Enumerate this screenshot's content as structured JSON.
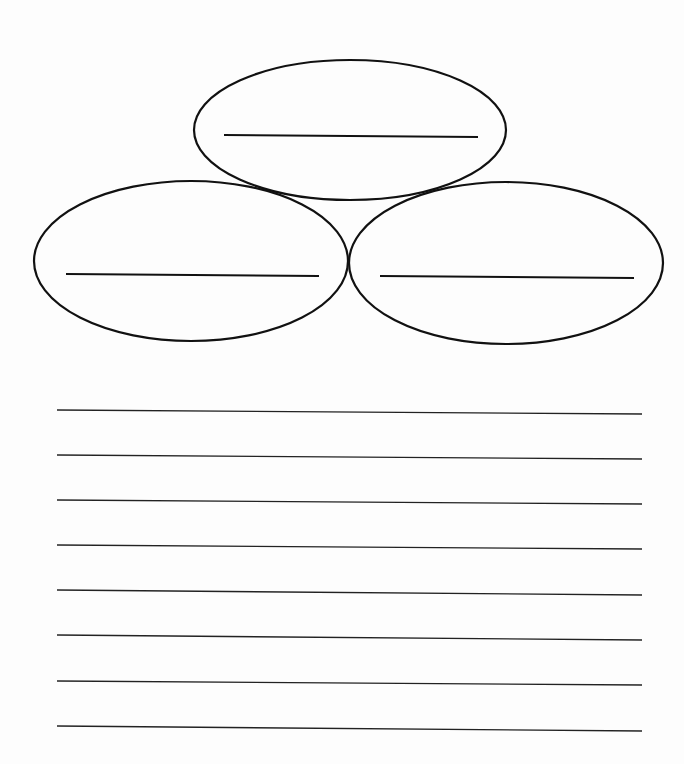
{
  "worksheet": {
    "background": "#fdfdfd",
    "stroke_color": "#111111",
    "ellipses": [
      {
        "id": "top",
        "cx": 350,
        "cy": 130,
        "rx": 156,
        "ry": 70,
        "line": {
          "x1": 224,
          "y1": 135,
          "x2": 478,
          "y2": 137
        }
      },
      {
        "id": "left",
        "cx": 191,
        "cy": 261,
        "rx": 157,
        "ry": 80,
        "line": {
          "x1": 66,
          "y1": 274,
          "x2": 319,
          "y2": 276
        }
      },
      {
        "id": "right",
        "cx": 506,
        "cy": 263,
        "rx": 157,
        "ry": 81,
        "line": {
          "x1": 380,
          "y1": 276,
          "x2": 634,
          "y2": 278
        }
      }
    ],
    "writing_lines": [
      {
        "x1": 57,
        "y1": 410,
        "x2": 642,
        "y2": 414
      },
      {
        "x1": 57,
        "y1": 455,
        "x2": 642,
        "y2": 459
      },
      {
        "x1": 57,
        "y1": 500,
        "x2": 642,
        "y2": 504
      },
      {
        "x1": 57,
        "y1": 545,
        "x2": 642,
        "y2": 549
      },
      {
        "x1": 57,
        "y1": 590,
        "x2": 642,
        "y2": 595
      },
      {
        "x1": 57,
        "y1": 635,
        "x2": 642,
        "y2": 640
      },
      {
        "x1": 57,
        "y1": 681,
        "x2": 642,
        "y2": 685
      },
      {
        "x1": 57,
        "y1": 726,
        "x2": 642,
        "y2": 731
      }
    ]
  }
}
